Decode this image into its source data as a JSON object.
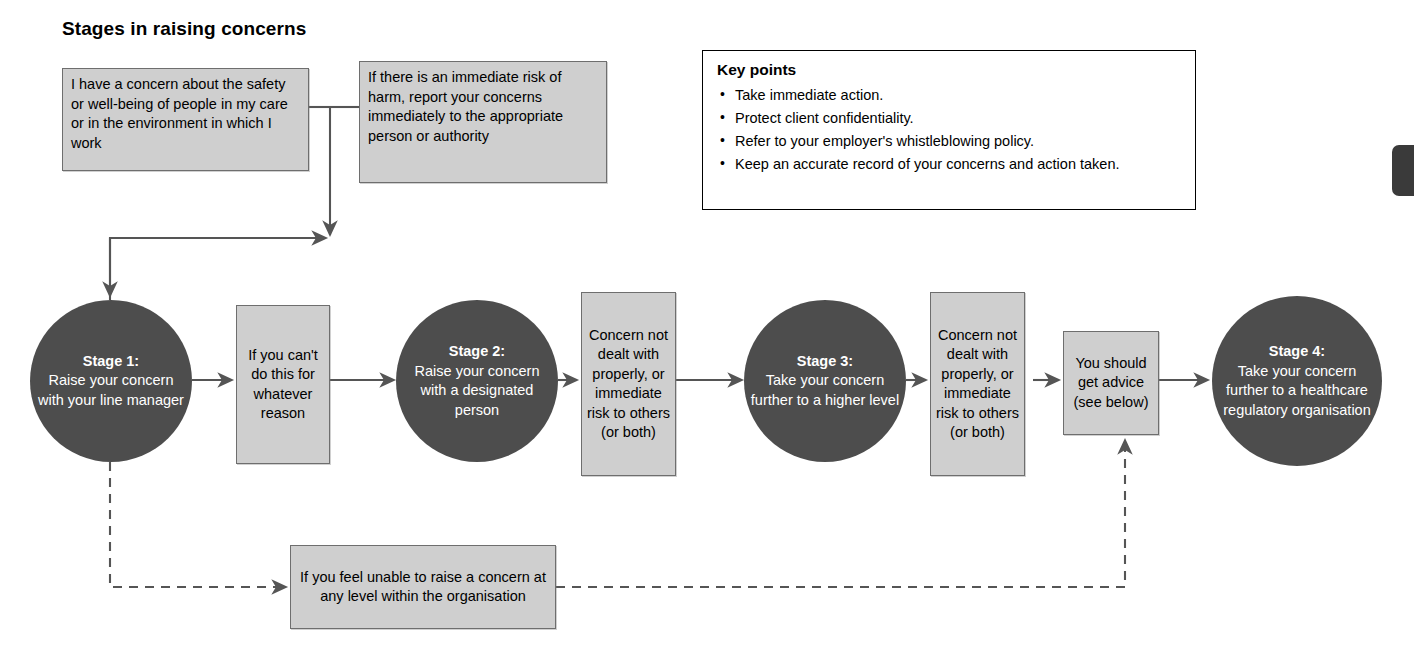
{
  "title": "Stages in raising concerns",
  "top_boxes": {
    "concern": "I have a concern about the safety or well-being of people in my care or in the environment in which I work",
    "immediate_risk": "If there is an immediate risk of harm, report your concerns immediately  to the appropriate person or authority"
  },
  "key_points": {
    "heading": "Key points",
    "items": [
      "Take immediate action.",
      "Protect client confidentiality.",
      "Refer to your employer's whistleblowing policy.",
      "Keep an accurate record of your concerns and action taken."
    ]
  },
  "stages": [
    {
      "label": "Stage 1:",
      "text": "Raise your concern with your line manager"
    },
    {
      "label": "Stage 2:",
      "text": "Raise your concern with a designated person"
    },
    {
      "label": "Stage 3:",
      "text": "Take your concern further to a higher level"
    },
    {
      "label": "Stage 4:",
      "text": "Take your concern further to a healthcare regulatory organisation"
    }
  ],
  "connector_boxes": {
    "cannot_do": "If you can't do this for whatever reason",
    "not_dealt_1": "Concern not dealt with properly, or immediate risk to others (or both)",
    "not_dealt_2": "Concern not dealt with properly, or immediate risk to others (or both)",
    "get_advice": "You should get advice (see below)",
    "unable_to_raise": "If you feel unable to raise a concern at any level within the organisation"
  },
  "colors": {
    "circle_fill": "#4d4d4d",
    "circle_text": "#ffffff",
    "box_fill": "#cfcfcf",
    "box_border": "#6e6e6e",
    "line": "#555555",
    "page_tab": "#3a3a3a"
  }
}
